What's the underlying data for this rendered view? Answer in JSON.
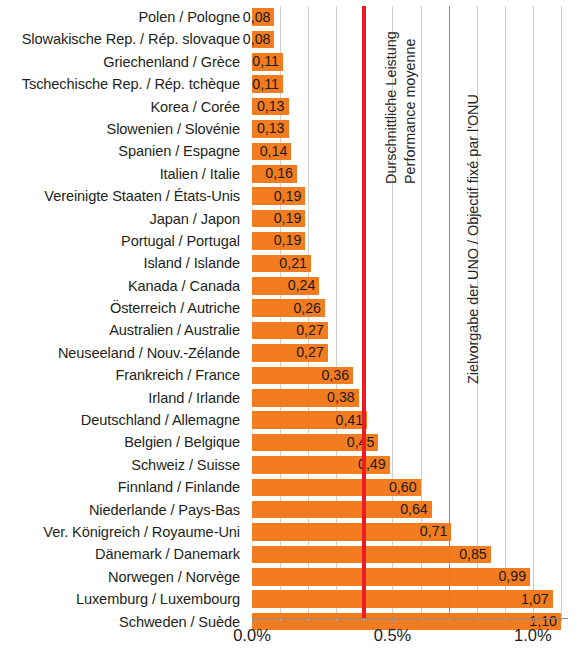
{
  "chart_data": {
    "type": "bar",
    "orientation": "horizontal",
    "title": "",
    "xlabel": "",
    "ylabel": "",
    "xlim": [
      0.0,
      1.125
    ],
    "grid": true,
    "value_format": "comma-decimal",
    "categories": [
      "Polen / Pologne",
      "Slowakische Rep. / Rép. slovaque",
      "Griechenland / Grèce",
      "Tschechische Rep. / Rép. tchèque",
      "Korea / Corée",
      "Slowenien / Slovénie",
      "Spanien / Espagne",
      "Italien / Italie",
      "Vereinigte Staaten / États-Unis",
      "Japan / Japon",
      "Portugal / Portugal",
      "Island / Islande",
      "Kanada / Canada",
      "Österreich / Autriche",
      "Australien / Australie",
      "Neuseeland  / Nouv.-Zélande",
      "Frankreich / France",
      "Irland / Irlande",
      "Deutschland / Allemagne",
      "Belgien / Belgique",
      "Schweiz / Suisse",
      "Finnland / Finlande",
      "Niederlande / Pays-Bas",
      "Ver. Königreich / Royaume-Uni",
      "Dänemark / Danemark",
      "Norwegen / Norvège",
      "Luxemburg / Luxembourg",
      "Schweden / Suède"
    ],
    "values": [
      0.08,
      0.08,
      0.11,
      0.11,
      0.13,
      0.13,
      0.14,
      0.16,
      0.19,
      0.19,
      0.19,
      0.21,
      0.24,
      0.26,
      0.27,
      0.27,
      0.36,
      0.38,
      0.41,
      0.45,
      0.49,
      0.6,
      0.64,
      0.71,
      0.85,
      0.99,
      1.07,
      1.1
    ],
    "value_labels": [
      "0,08",
      "0,08",
      "0,11",
      "0,11",
      "0,13",
      "0,13",
      "0,14",
      "0,16",
      "0,19",
      "0,19",
      "0,19",
      "0,21",
      "0,24",
      "0,26",
      "0,27",
      "0,27",
      "0,36",
      "0,38",
      "0,41",
      "0,45",
      "0,49",
      "0,60",
      "0,64",
      "0,71",
      "0,85",
      "0,99",
      "1,07",
      "1,10"
    ],
    "xticks": [
      0.0,
      0.5,
      1.0
    ],
    "xticklabels": [
      "0.0%",
      "0.5%",
      "1.0%"
    ],
    "minor_xticks": [
      0.1,
      0.2,
      0.3,
      0.4,
      0.6,
      0.7,
      0.8,
      0.9,
      1.1
    ],
    "gridlines": [
      0.1,
      0.2,
      0.3,
      0.5,
      0.6,
      0.8,
      0.9,
      1.0,
      1.1
    ],
    "reference_lines": [
      {
        "name": "average-performance",
        "value": 0.4,
        "color": "#ED1C24",
        "label_de": "Durschnittliche Leistung",
        "label_fr": "Performance moyenne"
      },
      {
        "name": "un-target",
        "value": 0.7,
        "color": "#8d8d8d",
        "label": "Zielvorgabe der UNO / Objectif fixé par l'ONU"
      }
    ],
    "bar_color": "#F47C20"
  },
  "annotations": {
    "average_de": "Durschnittliche Leistung",
    "average_fr": "Performance moyenne",
    "un_target": "Zielvorgabe der UNO / Objectif fixé par l'ONU"
  }
}
